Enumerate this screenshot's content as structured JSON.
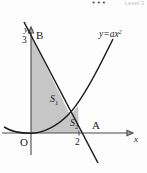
{
  "header": {
    "dots": "•••",
    "level_text": "Level 3"
  },
  "figure": {
    "name": "coordinate-geometry-diagram",
    "equation_label": {
      "base": "y=ax",
      "exponent": "2"
    },
    "axis_labels": {
      "x": "x",
      "y": "y"
    },
    "origin_label": "O",
    "points": [
      {
        "name": "B",
        "label": "B",
        "on_axis": "y"
      },
      {
        "name": "A",
        "label": "A",
        "on_axis": "x"
      }
    ],
    "tick_labels": [
      {
        "axis": "y",
        "value": "3"
      },
      {
        "axis": "x",
        "value": "2"
      }
    ],
    "regions": [
      {
        "name": "S1",
        "base": "S",
        "subscript": "1"
      },
      {
        "name": "S2",
        "base": "S",
        "subscript": "2"
      }
    ],
    "colors": {
      "shade": "#c6c6c6",
      "curve": "#1d1d1d",
      "axis": "#4a4a4a"
    }
  },
  "chart_data": {
    "type": "line",
    "title": "",
    "xlabel": "x",
    "ylabel": "y",
    "xlim": [
      -1.2,
      3.2
    ],
    "ylim": [
      -0.8,
      3.6
    ],
    "grid": false,
    "legend": "none",
    "series": [
      {
        "name": "parabola",
        "equation": "y=ax^2",
        "label": "y=ax2",
        "style": "curve"
      },
      {
        "name": "secant-AB",
        "equation": "line through B(0,3) and A(2,0)",
        "label": "",
        "style": "line"
      }
    ],
    "annotations": [
      {
        "text": "B",
        "x": 0,
        "y": 3
      },
      {
        "text": "3",
        "x": 0,
        "y": 3
      },
      {
        "text": "A",
        "x": 2,
        "y": 0
      },
      {
        "text": "2",
        "x": 2,
        "y": 0
      },
      {
        "text": "O",
        "x": 0,
        "y": 0
      },
      {
        "text": "S1",
        "x": 0.6,
        "y": 1.2
      },
      {
        "text": "S2",
        "x": 1.5,
        "y": 0.25
      },
      {
        "text": "y=ax2",
        "x": 2.4,
        "y": 3.2
      }
    ]
  }
}
